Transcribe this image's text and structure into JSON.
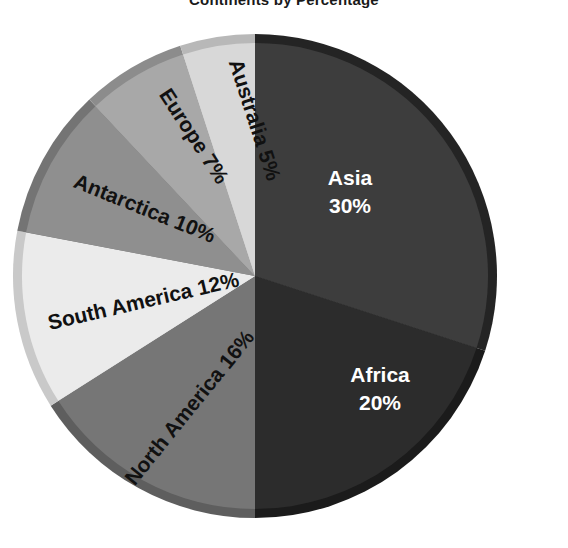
{
  "title": "Continents by Percentage",
  "chart_data": {
    "type": "pie",
    "title": "Continents by Percentage",
    "xlabel": "",
    "ylabel": "",
    "legend": "none",
    "grid": false,
    "units": "percent",
    "total": 100,
    "start_angle_deg": 0,
    "direction": "clockwise",
    "categories": [
      "Asia",
      "Africa",
      "North America",
      "South America",
      "Antarctica",
      "Europe",
      "Australia"
    ],
    "values": [
      30,
      20,
      16,
      12,
      10,
      7,
      5
    ],
    "slices": [
      {
        "name": "Asia",
        "label": "Asia",
        "percent_text": "30%",
        "value": 30,
        "color": "#3d3d3d",
        "edge_color": "#242424",
        "text_color": "#ffffff",
        "start_deg": 0,
        "end_deg": 108,
        "label_style": "horizontal",
        "label_x": 350,
        "label_y": 185,
        "rotation": 0
      },
      {
        "name": "Africa",
        "label": "Africa",
        "percent_text": "20%",
        "value": 20,
        "color": "#2c2c2c",
        "edge_color": "#1b1b1b",
        "text_color": "#ffffff",
        "start_deg": 108,
        "end_deg": 180,
        "label_style": "horizontal",
        "label_x": 380,
        "label_y": 382,
        "rotation": 0
      },
      {
        "name": "North America",
        "label": "North America 16%",
        "percent_text": "16%",
        "value": 16,
        "color": "#767676",
        "edge_color": "#5e5e5e",
        "text_color": "#111111",
        "start_deg": 180,
        "end_deg": 237.6,
        "label_style": "radial",
        "label_x": 195,
        "label_y": 412,
        "rotation": -51
      },
      {
        "name": "South America",
        "label": "South America 12%",
        "percent_text": "12%",
        "value": 12,
        "color": "#ebebeb",
        "edge_color": "#c9c9c9",
        "text_color": "#111111",
        "start_deg": 237.6,
        "end_deg": 280.8,
        "label_style": "radial",
        "label_x": 145,
        "label_y": 308,
        "rotation": -13
      },
      {
        "name": "Antarctica",
        "label": "Antarctica 10%",
        "percent_text": "10%",
        "value": 10,
        "color": "#8f8f8f",
        "edge_color": "#747474",
        "text_color": "#111111",
        "start_deg": 280.8,
        "end_deg": 316.8,
        "label_style": "radial",
        "label_x": 142,
        "label_y": 215,
        "rotation": 22
      },
      {
        "name": "Europe",
        "label": "Europe 7%",
        "percent_text": "7%",
        "value": 7,
        "color": "#a8a8a8",
        "edge_color": "#8c8c8c",
        "text_color": "#111111",
        "start_deg": 316.8,
        "end_deg": 342,
        "label_style": "radial",
        "label_x": 188,
        "label_y": 140,
        "rotation": 57
      },
      {
        "name": "Australia",
        "label": "Australia 5%",
        "percent_text": "5%",
        "value": 5,
        "color": "#d8d8d8",
        "edge_color": "#b8b8b8",
        "text_color": "#111111",
        "start_deg": 342,
        "end_deg": 360,
        "label_style": "radial",
        "label_x": 248,
        "label_y": 122,
        "rotation": 72
      }
    ],
    "geometry": {
      "center_x": 255,
      "center_y": 276,
      "radius": 242
    },
    "background": "#ffffff"
  }
}
